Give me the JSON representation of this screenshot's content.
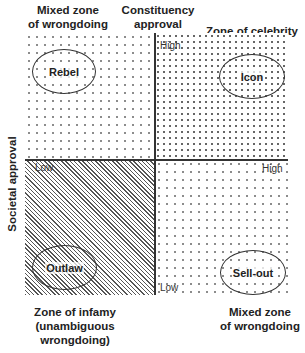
{
  "diagram": {
    "x_axis_title": "Constituency approval",
    "y_axis_title": "Societal approval",
    "ticks": {
      "y_high": "High",
      "y_low": "Low",
      "x_low": "Low",
      "x_high": "High"
    },
    "zone_labels": {
      "top_left": [
        "Mixed zone",
        "of wrongdoing"
      ],
      "top_right": "Zone of celebrity",
      "bottom_left": [
        "Zone of infamy",
        "(unambiguous",
        "wrongdoing)"
      ],
      "bottom_right": [
        "Mixed zone",
        "of wrongdoing"
      ]
    },
    "quadrants": {
      "top_left": {
        "label": "Rebel",
        "pattern": "sparse dots"
      },
      "top_right": {
        "label": "Icon",
        "pattern": "dense chevrons"
      },
      "bottom_left": {
        "label": "Outlaw",
        "pattern": "diagonal hatch"
      },
      "bottom_right": {
        "label": "Sell-out",
        "pattern": "sparse dots"
      }
    }
  }
}
